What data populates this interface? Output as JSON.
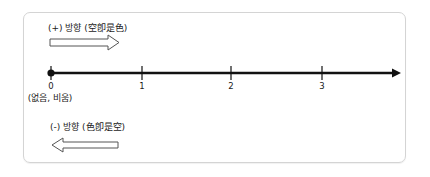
{
  "diagram": {
    "positive_direction": {
      "label": "(+) 방향 (空卽是色)",
      "arrow": "right-hollow-arrow"
    },
    "negative_direction": {
      "label": "(-) 방향 (色卽是空)",
      "arrow": "left-hollow-arrow"
    },
    "number_line": {
      "ticks": [
        "0",
        "1",
        "2",
        "3"
      ],
      "origin_note": "(없음, 비움)",
      "origin_marker": "filled-dot",
      "end": "arrowhead-right"
    },
    "colors": {
      "line": "#111111",
      "frame_border": "#d4d4d4",
      "arrow_outline": "#555555"
    }
  }
}
